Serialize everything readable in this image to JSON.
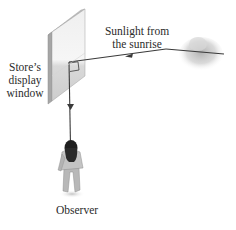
{
  "diagram": {
    "labels": {
      "window_line1": "Store’s",
      "window_line2": "display",
      "window_line3": "window",
      "sun_line1": "Sunlight from",
      "sun_line2": "the sunrise",
      "observer": "Observer"
    },
    "elements": [
      {
        "id": "display-window",
        "kind": "glass-panel"
      },
      {
        "id": "sun",
        "kind": "sun-on-horizon"
      },
      {
        "id": "incident-ray",
        "kind": "arrow-ray",
        "from": "sun",
        "to": "display-window"
      },
      {
        "id": "reflected-ray",
        "kind": "arrow-ray",
        "from": "display-window",
        "to": "observer"
      },
      {
        "id": "right-angle-marker",
        "kind": "angle-marker"
      },
      {
        "id": "observer",
        "kind": "person-figure"
      }
    ],
    "colors": {
      "ray": "#3a3a3a",
      "panel_face": "#e6e6e6",
      "panel_lower": "#cfcfcf",
      "panel_edge": "#9a9a9a",
      "sun_glow": "#bdbdbd",
      "text": "#2b2b2b"
    }
  }
}
